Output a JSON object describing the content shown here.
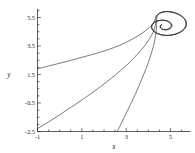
{
  "chart_data": {
    "type": "line",
    "title": "",
    "xlabel": "x",
    "ylabel": "y",
    "xlim": [
      -1.0,
      5.9
    ],
    "ylim": [
      -2.5,
      6.1
    ],
    "grid": false,
    "legend": null,
    "xticks": [
      -1,
      1,
      3,
      5
    ],
    "xtick_labels": [
      "-1",
      "1",
      "3",
      "5"
    ],
    "yticks": [
      -2.5,
      -0.5,
      1.5,
      3.5,
      5.5
    ],
    "ytick_labels": [
      "-2.5",
      "-0.5",
      "1.5",
      "3.5",
      "5.5"
    ],
    "minor_tick_step": 0.5,
    "line_color": "#2b2b2b",
    "background_color": "#ffffff",
    "focus_point": [
      4.6,
      5.0
    ],
    "series": [
      {
        "name": "trajectory-1",
        "start": [
          -1.0,
          1.9
        ],
        "points": [
          [
            -1.0,
            1.9
          ],
          [
            -0.45,
            2.12
          ],
          [
            0.15,
            2.35
          ],
          [
            0.8,
            2.62
          ],
          [
            1.45,
            2.9
          ],
          [
            2.1,
            3.2
          ],
          [
            2.7,
            3.55
          ],
          [
            3.2,
            3.92
          ],
          [
            3.62,
            4.3
          ],
          [
            3.95,
            4.68
          ],
          [
            4.18,
            5.02
          ],
          [
            4.3,
            5.35
          ],
          [
            4.35,
            5.6
          ],
          [
            4.52,
            5.82
          ],
          [
            4.8,
            5.92
          ],
          [
            5.15,
            5.86
          ],
          [
            5.45,
            5.66
          ],
          [
            5.66,
            5.36
          ],
          [
            5.72,
            5.02
          ],
          [
            5.62,
            4.68
          ],
          [
            5.38,
            4.42
          ],
          [
            5.05,
            4.27
          ],
          [
            4.72,
            4.25
          ],
          [
            4.42,
            4.36
          ],
          [
            4.22,
            4.57
          ],
          [
            4.14,
            4.82
          ],
          [
            4.2,
            5.07
          ],
          [
            4.38,
            5.25
          ],
          [
            4.62,
            5.32
          ],
          [
            4.86,
            5.26
          ],
          [
            5.02,
            5.1
          ],
          [
            5.06,
            4.9
          ],
          [
            4.98,
            4.73
          ],
          [
            4.82,
            4.64
          ],
          [
            4.66,
            4.66
          ],
          [
            4.55,
            4.77
          ],
          [
            4.53,
            4.9
          ],
          [
            4.6,
            5.0
          ]
        ]
      },
      {
        "name": "trajectory-2",
        "start": [
          -1.0,
          -2.3
        ],
        "points": [
          [
            -1.0,
            -2.3
          ],
          [
            -0.6,
            -1.92
          ],
          [
            -0.15,
            -1.48
          ],
          [
            0.32,
            -1.0
          ],
          [
            0.82,
            -0.48
          ],
          [
            1.32,
            0.06
          ],
          [
            1.82,
            0.62
          ],
          [
            2.3,
            1.2
          ],
          [
            2.75,
            1.78
          ],
          [
            3.16,
            2.36
          ],
          [
            3.5,
            2.92
          ],
          [
            3.8,
            3.45
          ],
          [
            4.02,
            3.95
          ],
          [
            4.2,
            4.42
          ],
          [
            4.3,
            4.85
          ],
          [
            4.34,
            5.25
          ],
          [
            4.36,
            5.58
          ],
          [
            4.52,
            5.82
          ],
          [
            4.8,
            5.92
          ],
          [
            5.15,
            5.86
          ],
          [
            5.45,
            5.66
          ],
          [
            5.66,
            5.36
          ],
          [
            5.72,
            5.02
          ],
          [
            5.62,
            4.68
          ],
          [
            5.38,
            4.42
          ],
          [
            5.05,
            4.27
          ],
          [
            4.72,
            4.25
          ],
          [
            4.42,
            4.36
          ],
          [
            4.22,
            4.57
          ],
          [
            4.14,
            4.82
          ],
          [
            4.2,
            5.07
          ],
          [
            4.38,
            5.25
          ],
          [
            4.62,
            5.32
          ],
          [
            4.86,
            5.26
          ],
          [
            5.02,
            5.1
          ],
          [
            5.06,
            4.9
          ],
          [
            4.98,
            4.73
          ],
          [
            4.82,
            4.64
          ],
          [
            4.66,
            4.66
          ],
          [
            4.55,
            4.77
          ],
          [
            4.53,
            4.9
          ],
          [
            4.6,
            5.0
          ]
        ]
      },
      {
        "name": "trajectory-3",
        "start": [
          2.6,
          -2.5
        ],
        "points": [
          [
            2.6,
            -2.5
          ],
          [
            2.74,
            -2.05
          ],
          [
            2.9,
            -1.55
          ],
          [
            3.06,
            -1.02
          ],
          [
            3.24,
            -0.45
          ],
          [
            3.42,
            0.15
          ],
          [
            3.6,
            0.78
          ],
          [
            3.76,
            1.4
          ],
          [
            3.92,
            2.0
          ],
          [
            4.05,
            2.58
          ],
          [
            4.16,
            3.12
          ],
          [
            4.25,
            3.62
          ],
          [
            4.31,
            4.08
          ],
          [
            4.35,
            4.52
          ],
          [
            4.37,
            4.95
          ],
          [
            4.38,
            5.35
          ],
          [
            4.42,
            5.66
          ],
          [
            4.6,
            5.86
          ],
          [
            4.9,
            5.92
          ],
          [
            5.22,
            5.8
          ],
          [
            5.5,
            5.58
          ],
          [
            5.66,
            5.28
          ],
          [
            5.68,
            4.96
          ],
          [
            5.56,
            4.64
          ],
          [
            5.32,
            4.4
          ],
          [
            5.0,
            4.26
          ],
          [
            4.68,
            4.27
          ],
          [
            4.4,
            4.4
          ],
          [
            4.22,
            4.62
          ],
          [
            4.16,
            4.86
          ],
          [
            4.24,
            5.1
          ],
          [
            4.42,
            5.26
          ],
          [
            4.66,
            5.3
          ],
          [
            4.88,
            5.22
          ],
          [
            5.0,
            5.05
          ],
          [
            5.02,
            4.87
          ],
          [
            4.92,
            4.72
          ],
          [
            4.76,
            4.66
          ],
          [
            4.62,
            4.7
          ],
          [
            4.55,
            4.82
          ],
          [
            4.56,
            4.94
          ],
          [
            4.6,
            5.0
          ]
        ]
      }
    ]
  }
}
